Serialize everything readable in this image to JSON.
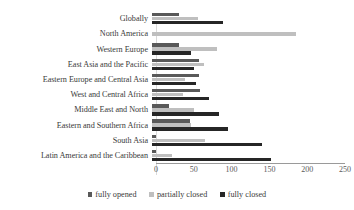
{
  "chart_data": {
    "type": "bar",
    "orientation": "horizontal",
    "title": "",
    "xlabel": "",
    "ylabel": "",
    "xlim": [
      0,
      250
    ],
    "xticks": [
      0,
      50,
      100,
      150,
      200,
      250
    ],
    "xtick_labels": [
      "0",
      "50",
      "100",
      "150",
      "200",
      "250"
    ],
    "grid": false,
    "legend_position": "bottom",
    "categories": [
      "Globally",
      "North America",
      "Western Europe",
      "East Asia and the Pacific",
      "Eastern Europe and Central Asia",
      "West and Central Africa",
      "Middle East and North",
      "Eastern and Southern Africa",
      "South Asia",
      "Latin America and the Caribbean"
    ],
    "series": [
      {
        "name": "fully opened",
        "color": "#595959",
        "values": [
          36,
          0,
          36,
          62,
          62,
          64,
          22,
          50,
          5,
          5
        ]
      },
      {
        "name": "partially closed",
        "color": "#bfbfbf",
        "values": [
          61,
          190,
          86,
          69,
          43,
          41,
          56,
          52,
          70,
          27
        ]
      },
      {
        "name": "fully closed",
        "color": "#262626",
        "values": [
          94,
          0,
          51,
          56,
          58,
          76,
          89,
          100,
          145,
          157
        ]
      }
    ]
  },
  "legend": {
    "items": [
      {
        "label": "fully opened",
        "swatch": "#595959"
      },
      {
        "label": "partially closed",
        "swatch": "#bfbfbf"
      },
      {
        "label": "fully closed",
        "swatch": "#262626"
      }
    ]
  }
}
